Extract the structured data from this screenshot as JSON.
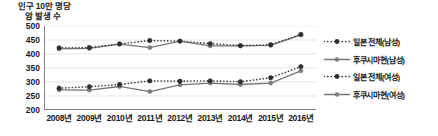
{
  "chart_data": {
    "type": "line",
    "title": "",
    "ylabel": "인구 10만 명당 암 발생 수",
    "ylabel_line1": "인구 10만 명당",
    "ylabel_line2": "암 발생 수",
    "xlabel": "",
    "categories": [
      "2008년",
      "2009년",
      "2010년",
      "2011년",
      "2012년",
      "2013년",
      "2014년",
      "2015년",
      "2016년"
    ],
    "x": [
      2008,
      2009,
      2010,
      2011,
      2012,
      2013,
      2014,
      2015,
      2016
    ],
    "ylim": [
      200,
      500
    ],
    "yticks": [
      500,
      450,
      400,
      350,
      300,
      250,
      200
    ],
    "ytick_labels": [
      "500",
      "450",
      "400",
      "350",
      "300",
      "250",
      "200"
    ],
    "grid": true,
    "legend_position": "right",
    "series": [
      {
        "name": "일본 전체(남성)",
        "style": "dotted",
        "marker": "circle",
        "color": "#4d4d4d",
        "values": [
          422,
          423,
          436,
          448,
          446,
          437,
          430,
          433,
          470
        ]
      },
      {
        "name": "후쿠시마현(남성)",
        "style": "solid",
        "marker": "circle",
        "color": "#6b6b6b",
        "values": [
          418,
          420,
          435,
          423,
          446,
          429,
          429,
          431,
          468
        ]
      },
      {
        "name": "일본 전체(여성)",
        "style": "dotted",
        "marker": "circle",
        "color": "#4d4d4d",
        "values": [
          278,
          283,
          291,
          304,
          303,
          304,
          301,
          315,
          355
        ]
      },
      {
        "name": "후쿠시마현(여성)",
        "style": "solid",
        "marker": "circle",
        "color": "#6b6b6b",
        "values": [
          272,
          271,
          284,
          266,
          290,
          296,
          291,
          296,
          340
        ]
      }
    ]
  },
  "legend": {
    "items": [
      {
        "label": "일본 전체(남성)",
        "style": "dotted",
        "marker": "circle"
      },
      {
        "label": "후쿠시마현(남성)",
        "style": "solid",
        "marker": "circle"
      },
      {
        "label": "일본 전체(여성)",
        "style": "dotted",
        "marker": "circle"
      },
      {
        "label": "후쿠시마현(여성)",
        "style": "solid",
        "marker": "circle"
      }
    ]
  },
  "colors": {
    "axis": "#808080",
    "grid": "#d9d9d9",
    "text": "#1a1a1a",
    "series_dotted": "#3d3d3d",
    "series_solid": "#757575",
    "background": "#ffffff"
  }
}
